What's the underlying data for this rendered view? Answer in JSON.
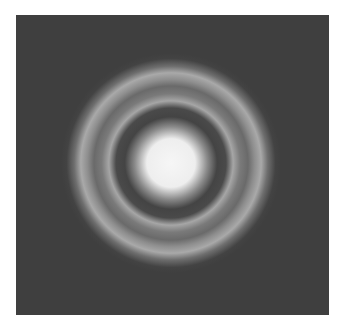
{
  "figure": {
    "colors": {
      "background": "#3f3f3f",
      "ring": "#a8a8a8",
      "center": "#f4f4f4",
      "page": "#ffffff"
    },
    "center": {
      "x": 155,
      "y": 148
    },
    "central_disk_radius": 32,
    "rings": [
      {
        "name": "inner-ring",
        "radius": 62,
        "width": 12
      },
      {
        "name": "outer-ring",
        "radius": 88,
        "width": 20
      }
    ]
  }
}
